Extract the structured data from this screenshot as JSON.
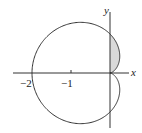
{
  "figure": {
    "curve": "cardioid r = 1 - cos(theta)",
    "axes": {
      "x_label": "x",
      "y_label": "y"
    },
    "ticks": [
      {
        "value": -2,
        "label": "−2"
      },
      {
        "value": -1,
        "label": "−1"
      }
    ],
    "shaded_region": "region inside cardioid lobe right of y-axis, first quadrant",
    "colors": {
      "curve": "#333333",
      "shade": "#d9d9d9",
      "axis": "#333333"
    }
  }
}
